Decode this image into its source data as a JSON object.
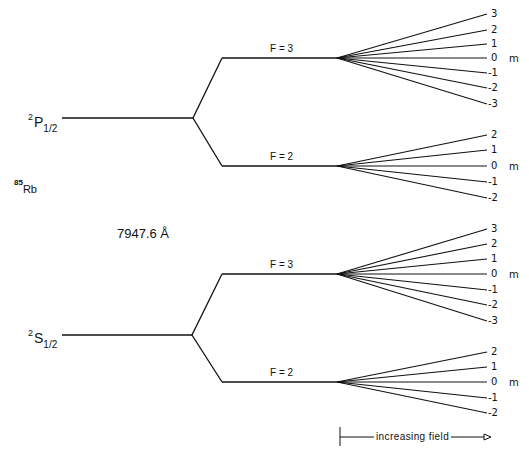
{
  "isotope": {
    "mass": "85",
    "symbol": "Rb"
  },
  "wavelength": "7947.6 Å",
  "upper_state": {
    "term": {
      "multiplicity": "2",
      "letter": "P",
      "j": "1/2"
    },
    "levels": [
      {
        "label": "F = 3",
        "m_values": [
          "3",
          "2",
          "1",
          "0",
          "-1",
          "-2",
          "-3"
        ]
      },
      {
        "label": "F = 2",
        "m_values": [
          "2",
          "1",
          "0",
          "-1",
          "-2"
        ]
      }
    ]
  },
  "lower_state": {
    "term": {
      "multiplicity": "2",
      "letter": "S",
      "j": "1/2"
    },
    "levels": [
      {
        "label": "F = 3",
        "m_values": [
          "3",
          "2",
          "1",
          "0",
          "-1",
          "-2",
          "-3"
        ]
      },
      {
        "label": "F = 2",
        "m_values": [
          "2",
          "1",
          "0",
          "-1",
          "-2"
        ]
      }
    ]
  },
  "m_axis_label": "m",
  "field_arrow_label": "increasing field"
}
